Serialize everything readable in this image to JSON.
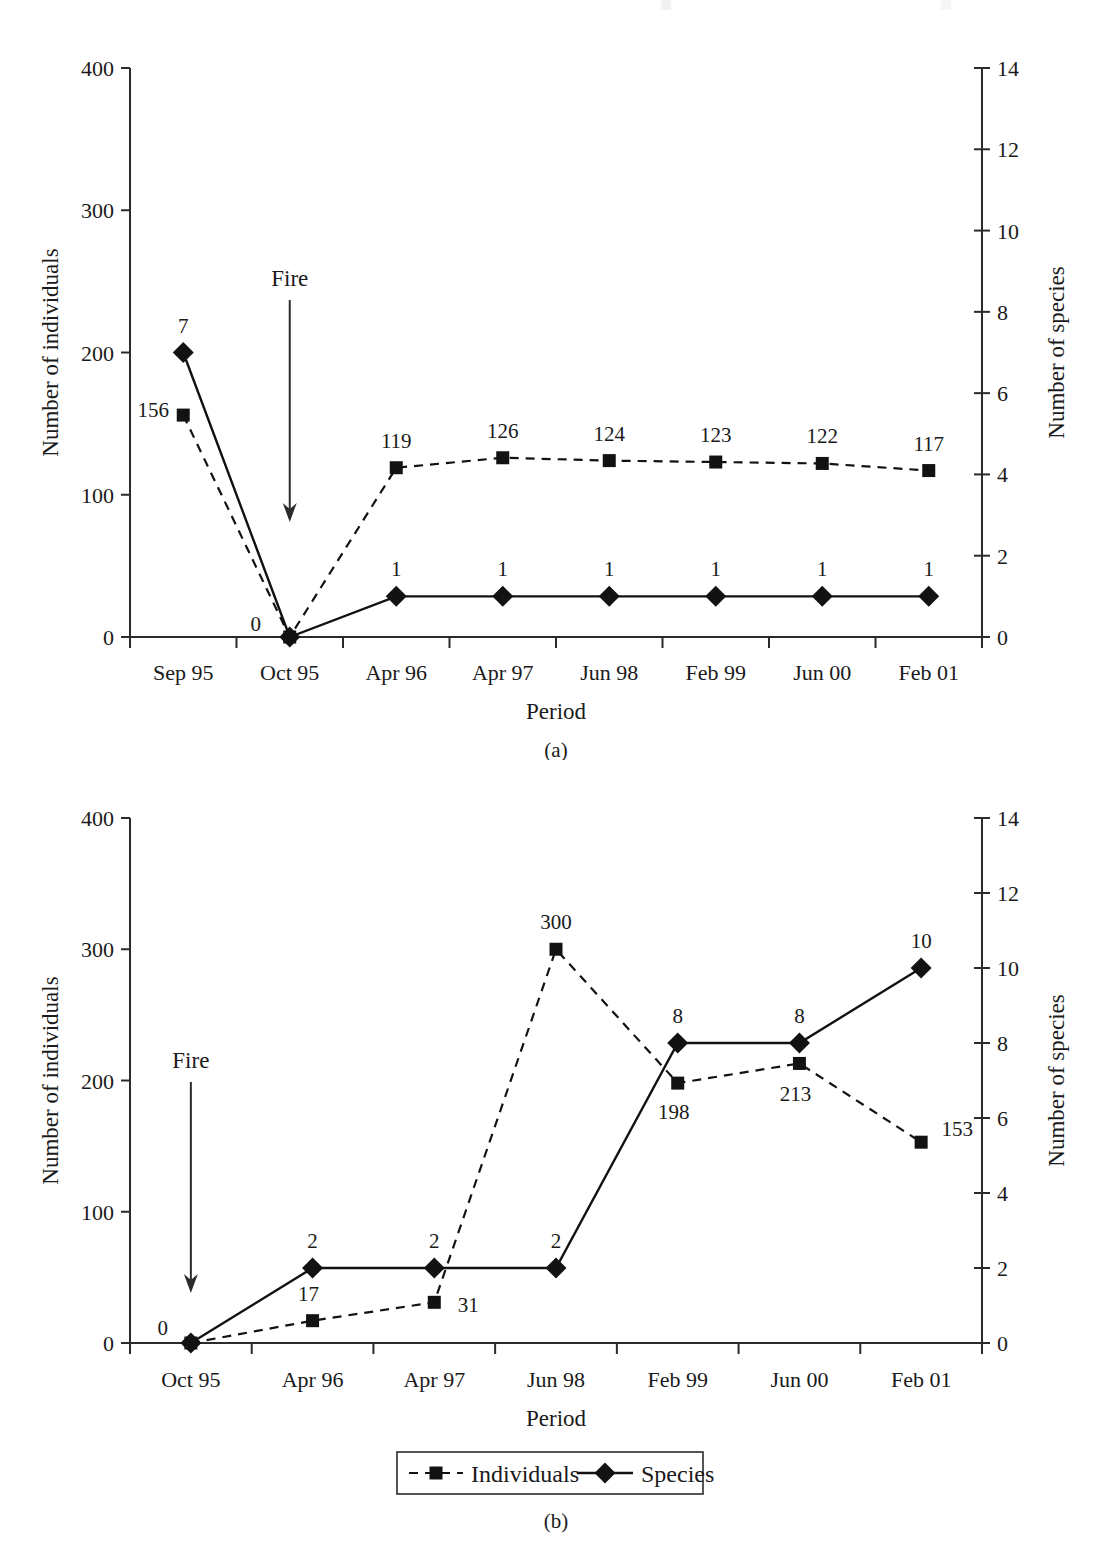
{
  "figure": {
    "panels": [
      {
        "caption": "(a)",
        "xlabel": "Period",
        "ylabel_left": "Number of individuals",
        "ylabel_right": "Number of species",
        "annotation": "Fire",
        "annotation_at_category": "Oct 95"
      },
      {
        "caption": "(b)",
        "xlabel": "Period",
        "ylabel_left": "Number of individuals",
        "ylabel_right": "Number of species",
        "annotation": "Fire",
        "annotation_at_category": "Oct 95"
      }
    ]
  },
  "legend": {
    "items": [
      {
        "label": "Individuals",
        "marker": "square",
        "line": "dashed"
      },
      {
        "label": "Species",
        "marker": "diamond",
        "line": "solid"
      }
    ]
  },
  "chart_data": [
    {
      "type": "line",
      "title": "(a)",
      "xlabel": "Period",
      "ylabel": "Number of individuals",
      "y2label": "Number of species",
      "categories": [
        "Sep 95",
        "Oct 95",
        "Apr 96",
        "Apr 97",
        "Jun 98",
        "Feb 99",
        "Jun 00",
        "Feb 01"
      ],
      "ylim": [
        0,
        400
      ],
      "yticks": [
        0,
        100,
        200,
        300,
        400
      ],
      "y2lim": [
        0,
        14
      ],
      "y2ticks": [
        0,
        2,
        4,
        6,
        8,
        10,
        12,
        14
      ],
      "grid": false,
      "legend_position": "below-figure",
      "annotations": [
        {
          "text": "Fire",
          "at_category": "Oct 95",
          "style": "down-arrow"
        }
      ],
      "series": [
        {
          "name": "Individuals",
          "axis": "left",
          "marker": "square",
          "line": "dashed",
          "values": [
            156,
            0,
            119,
            126,
            124,
            123,
            122,
            117
          ],
          "labels": [
            "156",
            "0",
            "119",
            "126",
            "124",
            "123",
            "122",
            "117"
          ]
        },
        {
          "name": "Species",
          "axis": "right",
          "marker": "diamond",
          "line": "solid",
          "values": [
            7,
            0,
            1,
            1,
            1,
            1,
            1,
            1
          ],
          "labels": [
            "7",
            "0",
            "1",
            "1",
            "1",
            "1",
            "1",
            "1"
          ]
        }
      ]
    },
    {
      "type": "line",
      "title": "(b)",
      "xlabel": "Period",
      "ylabel": "Number of individuals",
      "y2label": "Number of species",
      "categories": [
        "Oct 95",
        "Apr 96",
        "Apr 97",
        "Jun 98",
        "Feb 99",
        "Jun 00",
        "Feb 01"
      ],
      "ylim": [
        0,
        400
      ],
      "yticks": [
        0,
        100,
        200,
        300,
        400
      ],
      "y2lim": [
        0,
        14
      ],
      "y2ticks": [
        0,
        2,
        4,
        6,
        8,
        10,
        12,
        14
      ],
      "grid": false,
      "legend_position": "below-figure",
      "annotations": [
        {
          "text": "Fire",
          "at_category": "Oct 95",
          "style": "down-arrow"
        }
      ],
      "series": [
        {
          "name": "Individuals",
          "axis": "left",
          "marker": "square",
          "line": "dashed",
          "values": [
            0,
            17,
            31,
            300,
            198,
            213,
            153
          ],
          "labels": [
            "0",
            "17",
            "31",
            "300",
            "198",
            "213",
            "153"
          ]
        },
        {
          "name": "Species",
          "axis": "right",
          "marker": "diamond",
          "line": "solid",
          "values": [
            0,
            2,
            2,
            2,
            8,
            8,
            10
          ],
          "labels": [
            "0",
            "2",
            "2",
            "2",
            "8",
            "8",
            "10"
          ]
        }
      ]
    }
  ]
}
